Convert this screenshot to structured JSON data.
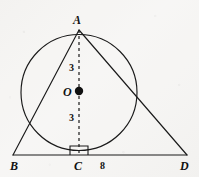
{
  "figure": {
    "kind": "circle-inscribed-triangle-diagram",
    "background_color": "#f6f5f3",
    "stroke_color": "#1a1a1a",
    "width": 199,
    "height": 177
  },
  "labels": {
    "apex": "A",
    "left_base": "B",
    "foot": "C",
    "right_base": "D",
    "center": "O",
    "upper_radius": "3",
    "lower_radius": "3",
    "base_segment": "8"
  },
  "geometry": {
    "circle": {
      "cx": 79,
      "cy": 92.5,
      "r": 58
    },
    "points": {
      "A": {
        "x": 79,
        "y": 30
      },
      "B": {
        "x": 13,
        "y": 155
      },
      "C": {
        "x": 79,
        "y": 155
      },
      "D": {
        "x": 187,
        "y": 155
      },
      "O": {
        "x": 79,
        "y": 91
      }
    },
    "segments": [
      {
        "name": "AB",
        "from": "A",
        "to": "B",
        "style": "solid"
      },
      {
        "name": "AD",
        "from": "A",
        "to": "D",
        "style": "solid"
      },
      {
        "name": "BD",
        "from": "B",
        "to": "D",
        "style": "solid"
      },
      {
        "name": "AC",
        "from": "A",
        "to": "C",
        "style": "dashed"
      }
    ],
    "right_angle_marker": {
      "x": 70,
      "y": 146,
      "size": 9,
      "at_point": "C"
    },
    "center_dot_radius": 4.2
  },
  "label_positions": {
    "A": {
      "left": 73,
      "top": 14
    },
    "B": {
      "left": 10,
      "top": 160
    },
    "C": {
      "left": 74,
      "top": 160
    },
    "D": {
      "left": 180,
      "top": 160
    },
    "O": {
      "left": 63,
      "top": 86
    },
    "upper_three": {
      "left": 69,
      "top": 63
    },
    "lower_three": {
      "left": 69,
      "top": 113
    },
    "eight": {
      "left": 100,
      "top": 161
    }
  }
}
